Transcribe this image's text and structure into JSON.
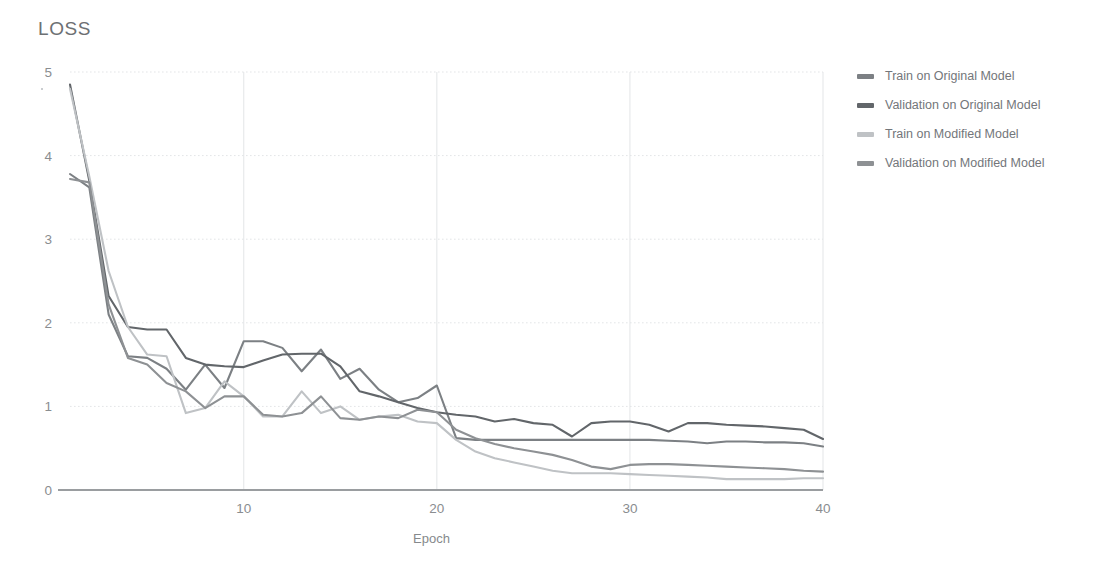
{
  "chart_data": {
    "type": "line",
    "title": "LOSS",
    "xlabel": "Epoch",
    "ylabel": "",
    "xlim": [
      1,
      40
    ],
    "ylim": [
      0,
      5
    ],
    "xticks": [
      10,
      20,
      30,
      40
    ],
    "yticks": [
      0,
      1,
      2,
      3,
      4,
      5
    ],
    "grid": true,
    "legend_position": "right",
    "x": [
      1,
      2,
      3,
      4,
      5,
      6,
      7,
      8,
      9,
      10,
      11,
      12,
      13,
      14,
      15,
      16,
      17,
      18,
      19,
      20,
      21,
      22,
      23,
      24,
      25,
      26,
      27,
      28,
      29,
      30,
      31,
      32,
      33,
      34,
      35,
      36,
      37,
      38,
      39,
      40
    ],
    "series": [
      {
        "name": "Train on Original Model",
        "color": "#7c8084",
        "values": [
          3.78,
          3.62,
          2.1,
          1.6,
          1.58,
          1.45,
          1.2,
          1.5,
          1.22,
          1.78,
          1.78,
          1.7,
          1.42,
          1.68,
          1.33,
          1.45,
          1.2,
          1.05,
          1.1,
          1.25,
          0.62,
          0.6,
          0.6,
          0.6,
          0.6,
          0.6,
          0.6,
          0.6,
          0.6,
          0.6,
          0.6,
          0.59,
          0.58,
          0.56,
          0.58,
          0.58,
          0.57,
          0.57,
          0.56,
          0.52
        ]
      },
      {
        "name": "Validation on Original Model",
        "color": "#62666a",
        "values": [
          4.85,
          3.7,
          2.32,
          1.95,
          1.92,
          1.92,
          1.58,
          1.5,
          1.48,
          1.47,
          1.55,
          1.62,
          1.63,
          1.63,
          1.48,
          1.18,
          1.12,
          1.05,
          0.98,
          0.93,
          0.9,
          0.88,
          0.82,
          0.85,
          0.8,
          0.78,
          0.64,
          0.8,
          0.82,
          0.82,
          0.78,
          0.7,
          0.8,
          0.8,
          0.78,
          0.77,
          0.76,
          0.74,
          0.72,
          0.61
        ]
      },
      {
        "name": "Train on Modified Model",
        "color": "#bfc2c5",
        "values": [
          4.8,
          3.75,
          2.62,
          1.95,
          1.62,
          1.6,
          0.92,
          0.98,
          1.3,
          1.12,
          0.88,
          0.88,
          1.18,
          0.92,
          1.0,
          0.84,
          0.88,
          0.9,
          0.82,
          0.8,
          0.6,
          0.46,
          0.38,
          0.33,
          0.28,
          0.23,
          0.2,
          0.2,
          0.2,
          0.19,
          0.18,
          0.17,
          0.16,
          0.15,
          0.13,
          0.13,
          0.13,
          0.13,
          0.14,
          0.14
        ]
      },
      {
        "name": "Validation on Modified Model",
        "color": "#8e9194",
        "values": [
          3.72,
          3.68,
          2.22,
          1.58,
          1.5,
          1.28,
          1.18,
          0.98,
          1.12,
          1.12,
          0.9,
          0.88,
          0.92,
          1.12,
          0.86,
          0.84,
          0.88,
          0.86,
          0.96,
          0.93,
          0.72,
          0.62,
          0.55,
          0.5,
          0.46,
          0.42,
          0.36,
          0.28,
          0.25,
          0.3,
          0.31,
          0.31,
          0.3,
          0.29,
          0.28,
          0.27,
          0.26,
          0.25,
          0.23,
          0.22
        ]
      }
    ]
  },
  "legend": {
    "items": [
      {
        "label": "Train on Original Model",
        "color": "#7c8084"
      },
      {
        "label": "Validation on Original Model",
        "color": "#62666a"
      },
      {
        "label": "Train on Modified Model",
        "color": "#bfc2c5"
      },
      {
        "label": "Validation on Modified Model",
        "color": "#8e9194"
      }
    ]
  },
  "axes": {
    "x_tick_labels": [
      "10",
      "20",
      "30",
      "40"
    ],
    "y_tick_labels": [
      "0",
      "1",
      "2",
      "3",
      "4",
      "5"
    ],
    "x_axis_title": "Epoch"
  },
  "colors": {
    "background": "#ffffff",
    "gridline": "#e3e5e7",
    "baseline": "#9a9da0",
    "text": "#8a8d90",
    "title_text": "#6d7073"
  }
}
